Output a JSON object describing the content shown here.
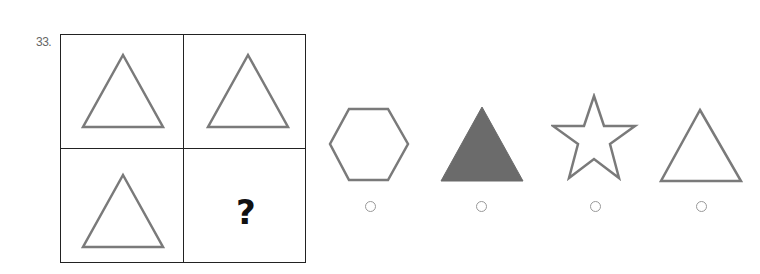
{
  "question": {
    "number": "33.",
    "grid": {
      "cells": [
        {
          "shape": "triangle-outline"
        },
        {
          "shape": "triangle-outline"
        },
        {
          "shape": "triangle-outline"
        },
        {
          "shape": "unknown",
          "label": "?"
        }
      ]
    },
    "options": [
      {
        "shape": "hexagon-outline",
        "selected": false
      },
      {
        "shape": "triangle-filled",
        "selected": false
      },
      {
        "shape": "star-outline",
        "selected": false
      },
      {
        "shape": "triangle-outline",
        "selected": false
      }
    ],
    "colors": {
      "shape_stroke": "#7a7a7a",
      "shape_fill": "#6b6b6b",
      "grid_line": "#222222"
    }
  }
}
